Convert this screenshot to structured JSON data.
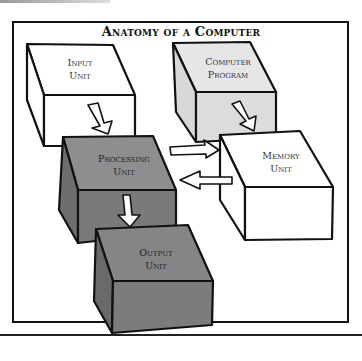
{
  "title": "Anatomy of a Computer",
  "boxes": [
    {
      "id": "input",
      "line1": "Input",
      "line2": "Unit",
      "fill": "#ffffff"
    },
    {
      "id": "program",
      "line1": "Computer",
      "line2": "Program",
      "fill": "#e4e4e4"
    },
    {
      "id": "processing",
      "line1": "Processing",
      "line2": "Unit",
      "fill": "#8a8a8a"
    },
    {
      "id": "memory",
      "line1": "Memory",
      "line2": "Unit",
      "fill": "#ffffff"
    },
    {
      "id": "output",
      "line1": "Output",
      "line2": "Unit",
      "fill": "#808080"
    }
  ],
  "arrows": [
    {
      "from": "input",
      "to": "processing"
    },
    {
      "from": "program",
      "to": "memory"
    },
    {
      "from": "processing",
      "to": "memory"
    },
    {
      "from": "memory",
      "to": "processing"
    },
    {
      "from": "processing",
      "to": "output"
    }
  ]
}
